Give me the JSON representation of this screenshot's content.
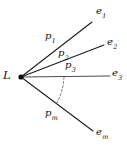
{
  "figure": {
    "kind": "fan-of-paths-diagram",
    "background_color": "#ffffff",
    "ink_color": "#111111",
    "dash_color": "#555555",
    "width": 127,
    "height": 145
  },
  "vertex": {
    "label": "L",
    "x": 21,
    "y": 77,
    "dot_radius": 2.6
  },
  "rays": [
    {
      "id": "ray-1",
      "path_label": "p",
      "path_subscript": "1",
      "endpoint_label": "e",
      "endpoint_subscript": "1",
      "x1": 21,
      "y1": 77,
      "x2": 92,
      "y2": 22
    },
    {
      "id": "ray-2",
      "path_label": "p",
      "path_subscript": "2",
      "endpoint_label": "e",
      "endpoint_subscript": "2",
      "x1": 21,
      "y1": 77,
      "x2": 104,
      "y2": 45
    },
    {
      "id": "ray-3",
      "path_label": "p",
      "path_subscript": "3",
      "endpoint_label": "e",
      "endpoint_subscript": "3",
      "x1": 21,
      "y1": 77,
      "x2": 110,
      "y2": 76
    },
    {
      "id": "ray-m",
      "path_label": "p",
      "path_subscript": "m",
      "endpoint_label": "e",
      "endpoint_subscript": "m",
      "x1": 21,
      "y1": 77,
      "x2": 93,
      "y2": 131
    }
  ],
  "ellipsis_arc": {
    "description": "dashed arc indicating omitted intermediate rays",
    "path": "M 64 77 Q 63 93 56 104"
  }
}
